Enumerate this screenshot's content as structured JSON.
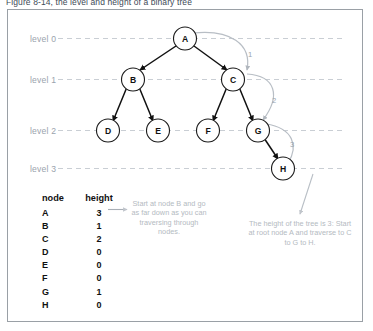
{
  "figure": {
    "caption": "Figure 8-14, the level and height of a binary tree"
  },
  "levels": [
    {
      "label": "level 0"
    },
    {
      "label": "level 1"
    },
    {
      "label": "level 2"
    },
    {
      "label": "level 3"
    }
  ],
  "tree": {
    "nodes": [
      {
        "id": "A",
        "label": "A",
        "level": 0
      },
      {
        "id": "B",
        "label": "B",
        "level": 1
      },
      {
        "id": "C",
        "label": "C",
        "level": 1
      },
      {
        "id": "D",
        "label": "D",
        "level": 2
      },
      {
        "id": "E",
        "label": "E",
        "level": 2
      },
      {
        "id": "F",
        "label": "F",
        "level": 2
      },
      {
        "id": "G",
        "label": "G",
        "level": 2
      },
      {
        "id": "H",
        "label": "H",
        "level": 3
      }
    ],
    "edges": [
      {
        "from": "A",
        "to": "B"
      },
      {
        "from": "A",
        "to": "C"
      },
      {
        "from": "B",
        "to": "D"
      },
      {
        "from": "B",
        "to": "E"
      },
      {
        "from": "C",
        "to": "F"
      },
      {
        "from": "C",
        "to": "G"
      },
      {
        "from": "G",
        "to": "H"
      }
    ],
    "height_arcs": [
      {
        "label": "1",
        "from": "A",
        "to": "C"
      },
      {
        "label": "2",
        "from": "C",
        "to": "G"
      },
      {
        "label": "3",
        "from": "G",
        "to": "H"
      }
    ]
  },
  "table": {
    "headers": {
      "node": "node",
      "height": "height"
    },
    "rows": [
      {
        "node": "A",
        "height": "3"
      },
      {
        "node": "B",
        "height": "1"
      },
      {
        "node": "C",
        "height": "2"
      },
      {
        "node": "D",
        "height": "0"
      },
      {
        "node": "E",
        "height": "0"
      },
      {
        "node": "F",
        "height": "0"
      },
      {
        "node": "G",
        "height": "1"
      },
      {
        "node": "H",
        "height": "0"
      }
    ]
  },
  "notes": {
    "left": "Start at node B and go as far down as you can traversing through nodes.",
    "right": "The height of the tree is 3: Start at root node A and traverse to C to G to H."
  },
  "colors": {
    "frame_border": "#9aa0a6",
    "level_line": "#c9ced4",
    "level_label": "#9aa3ad",
    "node_stroke": "#1a1a1a",
    "edge": "#111111",
    "arc": "#b8bec5",
    "note_text": "#b4bac1",
    "caption": "#3d4a57"
  }
}
